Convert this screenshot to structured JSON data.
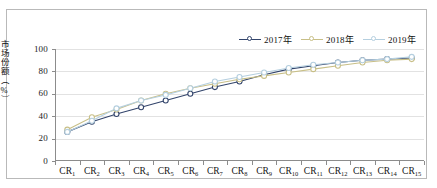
{
  "chart_data": {
    "type": "line",
    "title": "",
    "xlabel": "",
    "ylabel": "市场份额（%）",
    "ylim": [
      0,
      100
    ],
    "yticks": [
      0,
      20,
      40,
      60,
      80,
      100
    ],
    "grid": true,
    "legend_position": "top-right",
    "categories": [
      "CR1",
      "CR2",
      "CR3",
      "CR4",
      "CR5",
      "CR6",
      "CR7",
      "CR8",
      "CR9",
      "CR10",
      "CR11",
      "CR12",
      "CR13",
      "CR14",
      "CR15"
    ],
    "category_labels": [
      {
        "base": "CR",
        "sub": "1"
      },
      {
        "base": "CR",
        "sub": "2"
      },
      {
        "base": "CR",
        "sub": "3"
      },
      {
        "base": "CR",
        "sub": "4"
      },
      {
        "base": "CR",
        "sub": "5"
      },
      {
        "base": "CR",
        "sub": "6"
      },
      {
        "base": "CR",
        "sub": "7"
      },
      {
        "base": "CR",
        "sub": "8"
      },
      {
        "base": "CR",
        "sub": "9"
      },
      {
        "base": "CR",
        "sub": "10"
      },
      {
        "base": "CR",
        "sub": "11"
      },
      {
        "base": "CR",
        "sub": "12"
      },
      {
        "base": "CR",
        "sub": "13"
      },
      {
        "base": "CR",
        "sub": "14"
      },
      {
        "base": "CR",
        "sub": "15"
      }
    ],
    "series": [
      {
        "name": "2017年",
        "color": "#32446b",
        "marker": "circle",
        "values": [
          26,
          35,
          42,
          48,
          54,
          60,
          66,
          71,
          77,
          82,
          85,
          88,
          90,
          91,
          92
        ]
      },
      {
        "name": "2018年",
        "color": "#c8bf87",
        "marker": "circle",
        "values": [
          28,
          39,
          46,
          54,
          60,
          65,
          69,
          73,
          76,
          79,
          82,
          85,
          88,
          90,
          91
        ]
      },
      {
        "name": "2019年",
        "color": "#b5cfdf",
        "marker": "circle",
        "values": [
          26,
          36,
          47,
          54,
          59,
          65,
          71,
          75,
          79,
          83,
          86,
          88,
          90,
          91,
          93
        ]
      }
    ]
  },
  "legend": {
    "items": [
      {
        "label": "2017年",
        "color": "#32446b"
      },
      {
        "label": "2018年",
        "color": "#c8bf87"
      },
      {
        "label": "2019年",
        "color": "#b5cfdf"
      }
    ]
  },
  "axes": {
    "y_title": "市场份额（%）",
    "y_tick_labels": [
      "100",
      "80",
      "60",
      "40",
      "20",
      "0"
    ]
  }
}
